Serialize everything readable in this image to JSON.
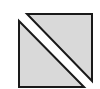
{
  "icon": {
    "name": "split-square-diagonal",
    "fill": "#d9d9d9",
    "stroke": "#1a1a1a",
    "background": "#ffffff"
  }
}
